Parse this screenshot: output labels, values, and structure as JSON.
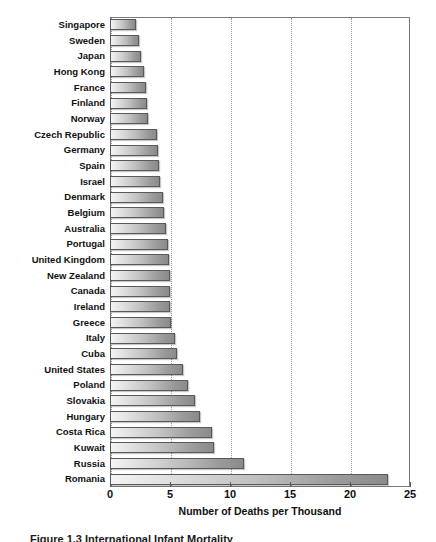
{
  "chart_data": {
    "type": "bar",
    "orientation": "horizontal",
    "title": "",
    "xlabel": "Number of Deaths per Thousand",
    "ylabel": "",
    "xlim": [
      0,
      25
    ],
    "xticks": [
      0,
      5,
      10,
      15,
      20,
      25
    ],
    "grid": "vertical-dotted",
    "legend": "none",
    "caption": "Figure 1.3 International Infant Mortality",
    "categories": [
      "Singapore",
      "Sweden",
      "Japan",
      "Hong Kong",
      "France",
      "Finland",
      "Norway",
      "Czech Republic",
      "Germany",
      "Spain",
      "Israel",
      "Denmark",
      "Belgium",
      "Australia",
      "Portugal",
      "United Kingdom",
      "New Zealand",
      "Canada",
      "Ireland",
      "Greece",
      "Italy",
      "Cuba",
      "United States",
      "Poland",
      "Slovakia",
      "Hungary",
      "Costa Rica",
      "Kuwait",
      "Russia",
      "Romania"
    ],
    "values": [
      2.2,
      2.4,
      2.6,
      2.8,
      3.0,
      3.1,
      3.2,
      3.9,
      4.0,
      4.1,
      4.2,
      4.4,
      4.5,
      4.7,
      4.8,
      4.9,
      5.0,
      5.0,
      5.0,
      5.1,
      5.4,
      5.6,
      6.1,
      6.5,
      7.1,
      7.5,
      8.5,
      8.7,
      11.2,
      23.2
    ],
    "colors": {
      "bar_fill_light": "#f4f4f4",
      "bar_fill_dark": "#8a8a8a",
      "bar_border": "#595959",
      "gridline": "#9a9a9a",
      "frame": "#7a7a7a",
      "text": "#101010"
    }
  }
}
